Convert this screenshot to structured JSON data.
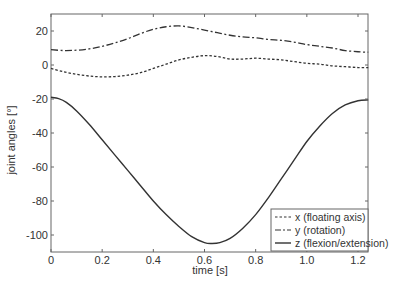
{
  "chart_data": {
    "type": "line",
    "title": "",
    "xlabel": "time [s]",
    "ylabel": "joint angles [°]",
    "xlim": [
      0,
      1.24
    ],
    "ylim": [
      -110,
      30
    ],
    "xticks": [
      0,
      0.2,
      0.4,
      0.6,
      0.8,
      1.0,
      1.2
    ],
    "xtick_labels": [
      "0",
      "0.2",
      "0.4",
      "0.6",
      "0.8",
      "1.0",
      "1.2"
    ],
    "yticks": [
      20,
      0,
      -20,
      -40,
      -60,
      -80,
      -100
    ],
    "ytick_labels": [
      "20",
      "0",
      "-20",
      "-40",
      "-60",
      "-80",
      "-100"
    ],
    "grid": false,
    "legend_position": "lower right",
    "series": [
      {
        "name": "x (floating axis)",
        "style": "dotted",
        "color": "#333333",
        "x": [
          0,
          0.05,
          0.1,
          0.15,
          0.2,
          0.25,
          0.3,
          0.35,
          0.4,
          0.45,
          0.5,
          0.55,
          0.6,
          0.65,
          0.7,
          0.75,
          0.8,
          0.85,
          0.9,
          0.95,
          1.0,
          1.05,
          1.1,
          1.15,
          1.2,
          1.24
        ],
        "y": [
          -2,
          -4,
          -5.5,
          -6.5,
          -7,
          -6.8,
          -6,
          -4.5,
          -2,
          0.5,
          3,
          4.5,
          5.5,
          5,
          3.5,
          3.5,
          4,
          3.5,
          3,
          2,
          1,
          0.5,
          -0.5,
          -1,
          -1.5,
          -1.5
        ]
      },
      {
        "name": "y (rotation)",
        "style": "dashdot",
        "color": "#333333",
        "x": [
          0,
          0.05,
          0.1,
          0.15,
          0.2,
          0.25,
          0.3,
          0.35,
          0.4,
          0.45,
          0.5,
          0.55,
          0.6,
          0.65,
          0.7,
          0.75,
          0.8,
          0.85,
          0.9,
          0.95,
          1.0,
          1.05,
          1.1,
          1.15,
          1.2,
          1.24
        ],
        "y": [
          9,
          8.5,
          8.7,
          9.5,
          11,
          13,
          15.5,
          18.5,
          21,
          22.5,
          23,
          22,
          20.5,
          19,
          17.5,
          16.5,
          16,
          15,
          14.5,
          13.5,
          12,
          11,
          10,
          8.5,
          7.8,
          7.5
        ]
      },
      {
        "name": "z (flexion/extension)",
        "style": "solid",
        "color": "#333333",
        "x": [
          0,
          0.03,
          0.06,
          0.1,
          0.15,
          0.2,
          0.25,
          0.3,
          0.35,
          0.4,
          0.45,
          0.5,
          0.55,
          0.6,
          0.63,
          0.66,
          0.7,
          0.75,
          0.8,
          0.85,
          0.9,
          0.95,
          1.0,
          1.05,
          1.1,
          1.15,
          1.2,
          1.24
        ],
        "y": [
          -19,
          -19.8,
          -22,
          -27,
          -35,
          -44,
          -53,
          -62,
          -71,
          -80,
          -88,
          -95,
          -101,
          -104.5,
          -105,
          -104.5,
          -102,
          -96,
          -88,
          -78,
          -67,
          -56,
          -45,
          -36,
          -28.5,
          -23.5,
          -21,
          -20.5
        ]
      }
    ]
  },
  "legend": {
    "items": [
      "x (floating axis)",
      "y (rotation)",
      "z (flexion/extension)"
    ]
  },
  "colors": {
    "axis": "#666666",
    "line": "#333333",
    "text": "#333333"
  }
}
